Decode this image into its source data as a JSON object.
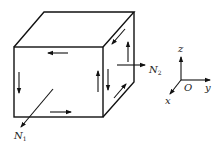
{
  "diagram": {
    "forces": [
      {
        "name": "N",
        "subscript": "1"
      },
      {
        "name": "N",
        "subscript": "2"
      }
    ],
    "axes": {
      "origin": "O",
      "x": "x",
      "y": "y",
      "z": "z"
    }
  }
}
